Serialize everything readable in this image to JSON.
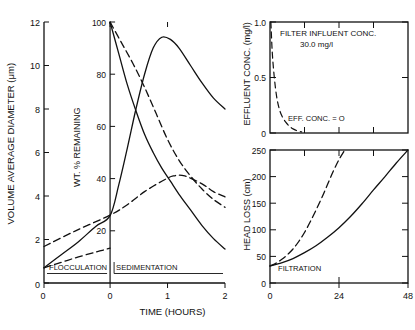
{
  "figure": {
    "background": "#ffffff",
    "ink": "#111111"
  },
  "panels": {
    "main": {
      "name": "flocculation-sedimentation-panel",
      "y_axis_label": "VOLUME AVERAGE DIAMETER  (μm)",
      "y_ticks": [
        "0",
        "2",
        "4",
        "6",
        "8",
        "10",
        "12"
      ],
      "x_axis_label": "TIME (HOURS)",
      "x_ticks": [
        "0",
        "0",
        "1",
        "2"
      ],
      "inner_axis_label": "WT. % REMAINING",
      "inner_ticks": [
        "20",
        "40",
        "60",
        "80",
        "100"
      ],
      "region_left_label": "FLOCCULATION",
      "region_right_label": "SEDIMENTATION"
    },
    "effluent": {
      "name": "effluent-concentration-panel",
      "y_axis_label": "EFFLUENT CONC. (mg/l)",
      "y_ticks": [
        "0",
        "0.5",
        "1.0"
      ],
      "annotation_line1": "FILTER INFLUENT CONC.",
      "annotation_line2": "30.0 mg/l",
      "annotation_curve": "EFF. CONC. = O"
    },
    "headloss": {
      "name": "head-loss-panel",
      "y_axis_label": "HEAD LOSS (cm)",
      "y_ticks": [
        "0",
        "50",
        "100",
        "150",
        "200",
        "250"
      ],
      "x_ticks": [
        "0",
        "24",
        "48"
      ],
      "region_label": "FILTRATION"
    }
  },
  "chart_data": [
    {
      "type": "line",
      "title": "Volume average diameter / weight percent remaining",
      "xlabel": "TIME (HOURS)",
      "ylabel": "VOLUME AVERAGE DIAMETER (μm)",
      "y2label": "WT. % REMAINING",
      "xlim": [
        -1.15,
        2.0
      ],
      "ylim": [
        0,
        12
      ],
      "y2lim": [
        0,
        100
      ],
      "grid": false,
      "divider_x": 0.0,
      "divider_style": "dashed",
      "regions": [
        "FLOCCULATION",
        "SEDIMENTATION"
      ],
      "series": [
        {
          "name": "volume-average-diameter-solid",
          "style": "solid",
          "axis": "left",
          "x": [
            -1.15,
            -0.85,
            -0.55,
            -0.25,
            0.0,
            0.15,
            0.3,
            0.45,
            0.6,
            0.75,
            0.9,
            1.05,
            1.2,
            1.4,
            1.6,
            1.8,
            2.0
          ],
          "y": [
            0.7,
            1.3,
            1.9,
            2.6,
            3.1,
            4.5,
            6.2,
            8.0,
            9.6,
            10.8,
            11.3,
            11.2,
            10.8,
            10.0,
            9.2,
            8.5,
            8.0
          ]
        },
        {
          "name": "flocculation-diameter-dashed",
          "style": "dashed",
          "axis": "left",
          "x": [
            -1.15,
            -0.85,
            -0.55,
            -0.25,
            0.0
          ],
          "y": [
            0.7,
            0.95,
            1.2,
            1.42,
            1.6
          ]
        },
        {
          "name": "wt-percent-remaining-solid",
          "style": "solid",
          "axis": "right",
          "x": [
            0.0,
            0.15,
            0.3,
            0.45,
            0.6,
            0.75,
            0.9,
            1.05,
            1.2,
            1.4,
            1.6,
            1.8,
            2.0
          ],
          "y": [
            100,
            88,
            76,
            66,
            57,
            50,
            44,
            39,
            34,
            28,
            22,
            17,
            13
          ]
        },
        {
          "name": "wt-percent-remaining-dashed-upper",
          "style": "dashed",
          "axis": "right",
          "x": [
            0.0,
            0.2,
            0.4,
            0.6,
            0.8,
            1.0,
            1.2,
            1.4,
            1.6,
            1.8,
            2.0
          ],
          "y": [
            100,
            92,
            84,
            75,
            65,
            55,
            47,
            41,
            36,
            32,
            29
          ]
        },
        {
          "name": "wt-percent-remaining-dashed-lower",
          "style": "dashed",
          "axis": "right",
          "x": [
            -1.15,
            -0.6,
            0.0,
            0.3,
            0.6,
            0.9,
            1.1,
            1.3,
            1.6,
            1.8,
            2.0
          ],
          "y": [
            14,
            20,
            26,
            30,
            35,
            39,
            41,
            41,
            38,
            35,
            33
          ]
        }
      ]
    },
    {
      "type": "line",
      "title": "Effluent concentration during filtration",
      "xlabel": "",
      "ylabel": "EFFLUENT CONC. (mg/l)",
      "xlim": [
        0,
        48
      ],
      "ylim": [
        0,
        1.0
      ],
      "grid": false,
      "annotations": [
        "FILTER INFLUENT CONC.",
        "30.0 mg/l",
        "EFF. CONC. = O"
      ],
      "series": [
        {
          "name": "effluent-concentration-dashed",
          "style": "dashed",
          "x": [
            0.3,
            0.8,
            1.5,
            2.3,
            3.2,
            4.2,
            5.4,
            6.8,
            8.2,
            9.6,
            11.0
          ],
          "y": [
            1.0,
            0.72,
            0.5,
            0.33,
            0.22,
            0.15,
            0.1,
            0.06,
            0.035,
            0.018,
            0.01
          ]
        }
      ]
    },
    {
      "type": "line",
      "title": "Head loss during filtration",
      "xlabel": "TIME (HOURS)",
      "ylabel": "HEAD LOSS (cm)",
      "xlim": [
        0,
        48
      ],
      "ylim": [
        0,
        250
      ],
      "grid": false,
      "region_label": "FILTRATION",
      "series": [
        {
          "name": "head-loss-solid",
          "style": "solid",
          "x": [
            0,
            4,
            8,
            12,
            16,
            20,
            24,
            28,
            32,
            36,
            40,
            44,
            48
          ],
          "y": [
            32,
            38,
            46,
            57,
            70,
            86,
            104,
            125,
            149,
            175,
            200,
            226,
            250
          ]
        },
        {
          "name": "head-loss-dashed",
          "style": "dashed",
          "x": [
            0,
            2,
            4,
            6,
            8,
            10,
            12,
            14,
            16,
            18,
            20,
            22,
            24,
            26
          ],
          "y": [
            32,
            37,
            44,
            53,
            64,
            78,
            95,
            115,
            137,
            160,
            185,
            210,
            232,
            250
          ]
        }
      ]
    }
  ]
}
